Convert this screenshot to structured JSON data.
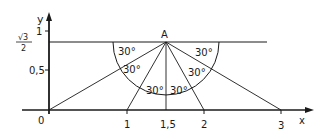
{
  "diagram": {
    "axes": {
      "x_label": "x",
      "y_label": "y",
      "x_ticks": [
        {
          "label": "0",
          "value": 0
        },
        {
          "label": "1",
          "value": 1
        },
        {
          "label": "1,5",
          "value": 1.5
        },
        {
          "label": "2",
          "value": 2
        },
        {
          "label": "3",
          "value": 3
        }
      ],
      "y_ticks": [
        {
          "label": "0,5",
          "value": 0.5
        },
        {
          "label": "1",
          "value": 1
        }
      ],
      "y_special_label": {
        "numerator": "√3",
        "denominator": "2"
      }
    },
    "point": {
      "label": "A",
      "x": 1.5,
      "y": 0.866
    },
    "angles": [
      "30°",
      "30°",
      "30°",
      "30°",
      "30°",
      "30°"
    ],
    "colors": {
      "ink": "#1a1a1a",
      "background": "#ffffff"
    }
  }
}
